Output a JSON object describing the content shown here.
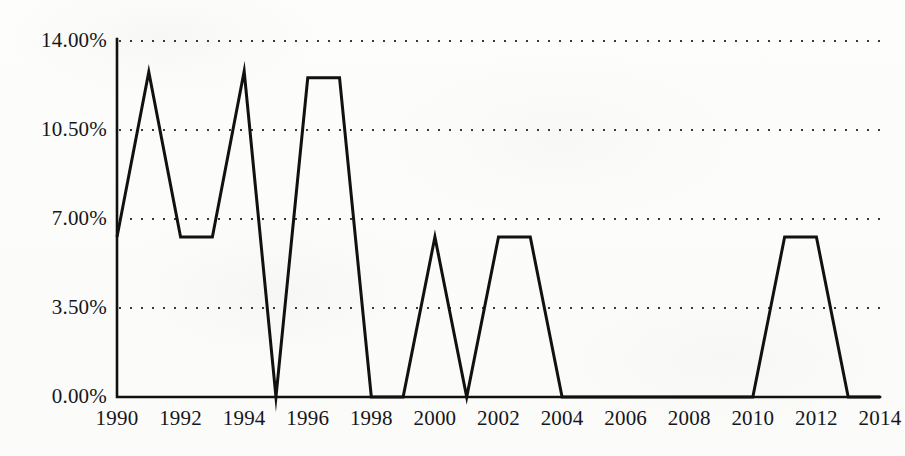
{
  "chart_data": {
    "type": "line",
    "title": "",
    "subtitle": "",
    "xlabel": "",
    "ylabel": "",
    "x": [
      1990,
      1991,
      1992,
      1993,
      1994,
      1995,
      1996,
      1997,
      1998,
      1999,
      2000,
      2001,
      2002,
      2003,
      2004,
      2005,
      2006,
      2007,
      2008,
      2009,
      2010,
      2011,
      2012,
      2013,
      2014
    ],
    "values": [
      6.29,
      12.78,
      6.29,
      6.29,
      12.81,
      0.0,
      12.55,
      12.55,
      0.0,
      0.0,
      6.29,
      0.0,
      6.29,
      6.29,
      0.0,
      0.0,
      0.0,
      0.0,
      0.0,
      0.0,
      0.0,
      6.29,
      6.29,
      0.0,
      0.0
    ],
    "series": [
      {
        "name": "",
        "values": [
          6.29,
          12.78,
          6.29,
          6.29,
          12.81,
          0.0,
          12.55,
          12.55,
          0.0,
          0.0,
          6.29,
          0.0,
          6.29,
          6.29,
          0.0,
          0.0,
          0.0,
          0.0,
          0.0,
          0.0,
          0.0,
          6.29,
          6.29,
          0.0,
          0.0
        ],
        "color": "#111111"
      }
    ],
    "ylim": [
      0,
      14
    ],
    "xlim": [
      1990,
      2014
    ],
    "y_ticks": [
      0,
      3.5,
      7,
      10.5,
      14
    ],
    "y_tick_labels": [
      "0.00%",
      "3.50%",
      "7.00%",
      "10.50%",
      "14.00%"
    ],
    "x_ticks": [
      1990,
      1992,
      1994,
      1996,
      1998,
      2000,
      2002,
      2004,
      2006,
      2008,
      2010,
      2012,
      2014
    ],
    "x_tick_labels": [
      "1990",
      "1992",
      "1994",
      "1996",
      "1998",
      "2000",
      "2002",
      "2004",
      "2006",
      "2008",
      "2010",
      "2012",
      "2014"
    ],
    "grid": true,
    "grid_style": "dotted",
    "grid_axis": "y",
    "legend": false,
    "legend_position": "none",
    "line_color": "#111111",
    "line_width": 3,
    "markers": false,
    "background_color": "#fdfdfb",
    "axis_color": "#111111"
  }
}
